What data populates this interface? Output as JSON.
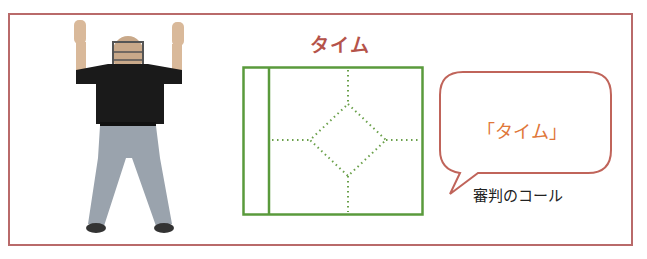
{
  "title": "タイム",
  "speech_bubble": {
    "text": "「タイム」"
  },
  "caption": "審判のコール",
  "figure": {
    "colors": {
      "shirt": "#1a1a1a",
      "pants": "#9aa3ad",
      "skin": "#d9b99a"
    }
  },
  "diagram": {
    "name": "baseball-field",
    "line_color": "#5a9a3c"
  },
  "colors": {
    "frame": "#b96a6a",
    "title": "#b5534a",
    "bubble_border": "#c0645a",
    "bubble_text": "#e0773a"
  }
}
